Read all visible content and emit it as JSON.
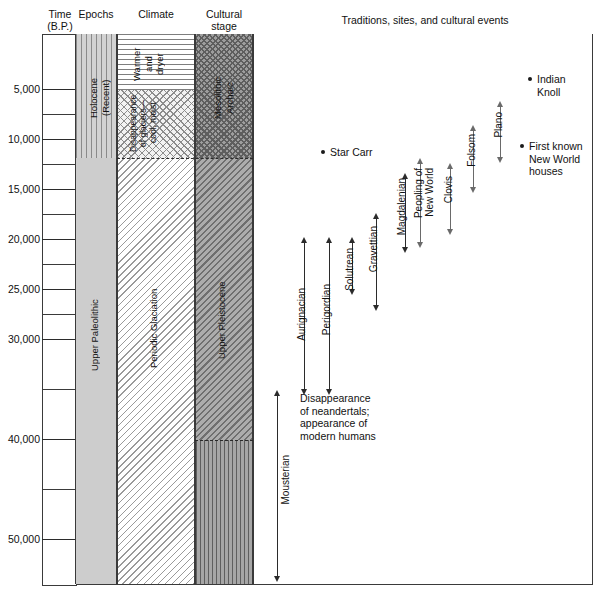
{
  "headers": {
    "time": "Time",
    "time_sub": "(B.P.)",
    "epochs": "Epochs",
    "climate": "Climate",
    "cultural": "Cultural",
    "cultural_sub": "stage",
    "events": "Traditions, sites, and cultural events"
  },
  "axis": {
    "unit": "B.P.",
    "labels": [
      "5,000",
      "10,000",
      "15,000",
      "20,000",
      "25,000",
      "30,000",
      "40,000",
      "50,000"
    ],
    "min": 0,
    "max": 55000,
    "tick_interval": 5000
  },
  "columns": {
    "epochs": [
      {
        "label": "Holocene\n(Recent)",
        "label_line1": "Holocene",
        "label_line2": "(Recent)",
        "from": 0,
        "to": 11800
      },
      {
        "label": "",
        "from": 11800,
        "to": 55000
      }
    ],
    "climate": [
      {
        "label": "Warmer and dryer",
        "label_line1": "Warmer",
        "label_line2": "and",
        "label_line3": "dryer",
        "from": 0,
        "to": 5500
      },
      {
        "label": "Disappearance of glaciers — cool, moist",
        "label_line1": "Disappearance",
        "label_line2": "of glaciers—",
        "label_line3": "cool, moist",
        "from": 5500,
        "to": 11800
      },
      {
        "label": "Periodic Glaciation",
        "from": 11800,
        "to": 55000
      }
    ],
    "cultural": [
      {
        "label": "Mesolithic Archaic",
        "label_line1": "Mesolithic",
        "label_line2": "Archaic",
        "from": 0,
        "to": 11800
      },
      {
        "label": "Upper Paleolithic",
        "from": 11800,
        "to": 40000
      },
      {
        "label": "",
        "from": 40000,
        "to": 55000
      }
    ],
    "epochs_lower_label": "Upper Paleolithic",
    "pleistocene_label": "Upper Pleistocene"
  },
  "traditions": [
    {
      "name": "Mousterian",
      "from": 55000,
      "to": 37000,
      "style": "bold"
    },
    {
      "name": "Aurignacian",
      "from": 34000,
      "to": 21000,
      "style": "bold"
    },
    {
      "name": "Perigordian",
      "from": 34000,
      "to": 22500,
      "style": "bold"
    },
    {
      "name": "Solutrean",
      "from": 25000,
      "to": 20500,
      "style": "bold"
    },
    {
      "name": "Gravettian",
      "from": 27500,
      "to": 18500,
      "style": "bold"
    },
    {
      "name": "Magdalenian",
      "from": 20500,
      "to": 14000,
      "style": "bold"
    },
    {
      "name": "Peopling of New World",
      "name_line1": "Peopling of",
      "name_line2": "New World",
      "from": 20000,
      "to": 13000,
      "style": "thin"
    },
    {
      "name": "Clovis",
      "from": 17000,
      "to": 12000,
      "style": "thin"
    },
    {
      "name": "Folsom",
      "from": 14500,
      "to": 9500,
      "style": "thin"
    },
    {
      "name": "Plano",
      "from": 12000,
      "to": 7500,
      "style": "thin"
    }
  ],
  "sites": [
    {
      "name": "Star Carr",
      "at": 9700,
      "lines": [
        "Star Carr"
      ]
    },
    {
      "name": "Indian Knoll",
      "at": 4200,
      "lines": [
        "Indian",
        "Knoll"
      ]
    },
    {
      "name": "First known New World houses",
      "at": 10200,
      "lines": [
        "First known",
        "New World",
        "houses"
      ]
    }
  ],
  "notes": [
    {
      "id": "neandertal-note",
      "lines": [
        "Disappearance",
        "of neandertals;",
        "appearance of",
        "modern humans"
      ],
      "at": 36500
    }
  ],
  "colors": {
    "ink": "#1a1a1a",
    "rule": "#3a3a3a",
    "epoch_fill": "#cfcfcf",
    "cultural_fill": "#9d9d9d",
    "arrow": "#2b2b2b",
    "arrow_thin": "#6a6a6a"
  }
}
